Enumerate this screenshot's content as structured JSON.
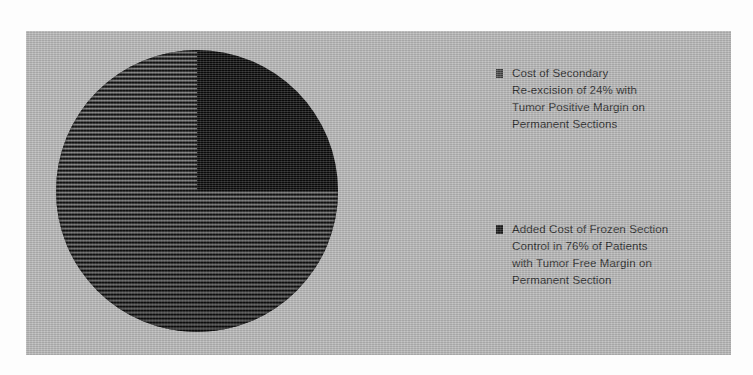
{
  "chart_data": {
    "type": "pie",
    "title": "",
    "categories": [
      "Cost of Secondary Re-excision of 24% with Tumor Positive Margin on Permanent Sections",
      "Added Cost of Frozen Section Control in 76% of Patients with Tumor Free Margin on Permanent Section"
    ],
    "values": [
      24,
      76
    ],
    "units": "percent",
    "legend_position": "right",
    "grid": false,
    "xlabel": "",
    "ylabel": ""
  },
  "legend": {
    "entries": [
      {
        "label": "Cost of Secondary\nRe-excision of 24% with\nTumor Positive Margin on\nPermanent Sections",
        "value": 24,
        "swatch": "solid-black-square",
        "color": "#0b0b0b"
      },
      {
        "label": "Added Cost of Frozen Section\nControl in 76% of Patients\nwith Tumor Free Margin on\nPermanent Section",
        "value": 76,
        "swatch": "dark-hatched-square",
        "color": "#3a3a3a"
      }
    ]
  },
  "panel": {
    "background_color": "#b6b6b6",
    "page_background_color": "#fdfdfd"
  }
}
